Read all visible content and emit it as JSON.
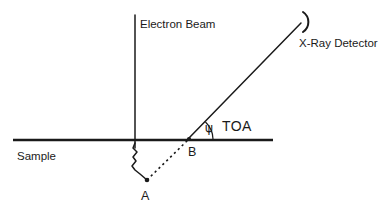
{
  "figure": {
    "kind": "schematic-diagram",
    "background_color": "#ffffff",
    "ink_color": "#1a1a1a",
    "width": 392,
    "height": 213
  },
  "labels": {
    "electron_beam": "Electron Beam",
    "xray_detector": "X-Ray Detector",
    "sample": "Sample",
    "toa": "TOA",
    "psi": "ψ",
    "point_a": "A",
    "point_b": "B"
  },
  "geometry": {
    "surface_line": {
      "x1": 13,
      "y1": 140,
      "x2": 273,
      "y2": 140
    },
    "beam_line": {
      "x1": 135,
      "y1": 15,
      "x2": 135,
      "y2": 148
    },
    "detector_line": {
      "x1": 189,
      "y1": 138,
      "x2": 301,
      "y2": 23
    },
    "detector_arc": {
      "cx": 309,
      "cy": 22,
      "r": 12,
      "start_deg": 120,
      "end_deg": 240
    },
    "xray_dashed_line": {
      "x1": 147,
      "y1": 180,
      "x2": 189,
      "y2": 139
    },
    "angle_arc": {
      "cx": 189,
      "cy": 139,
      "r": 24,
      "from_deg": 0,
      "to_deg": 46
    },
    "point_a": {
      "x": 147,
      "y": 180
    },
    "point_b": {
      "x": 189,
      "y": 139
    },
    "scatter_path_points": [
      [
        135,
        143
      ],
      [
        133,
        148
      ],
      [
        137,
        152
      ],
      [
        133,
        157
      ],
      [
        136,
        161
      ],
      [
        132,
        166
      ],
      [
        135,
        170
      ],
      [
        140,
        174
      ],
      [
        147,
        180
      ]
    ]
  },
  "annotations": {
    "toa_angle_description": "Take-off angle ψ measured between the sample surface and the line to the X-ray detector",
    "point_a_description": "Point A — X-ray generation site within the interaction volume below the surface",
    "point_b_description": "Point B — where the emitted X-ray exits the sample surface toward the detector"
  }
}
